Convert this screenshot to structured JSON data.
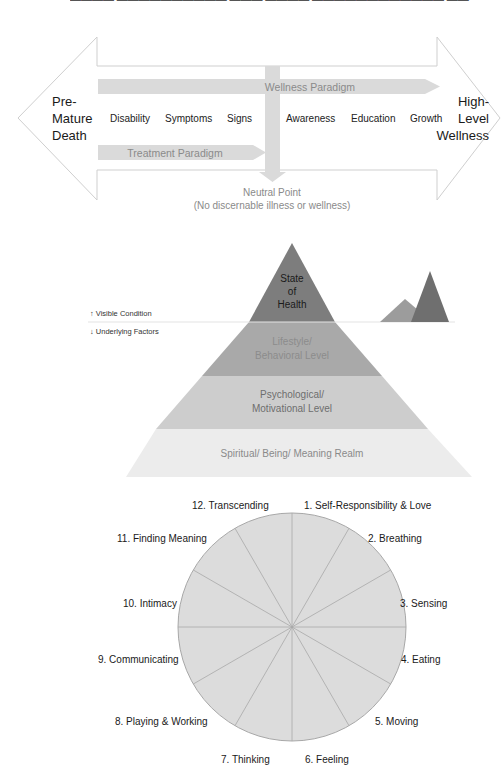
{
  "header": {
    "clipped_caption": "(text clipped at top edge — illegible)"
  },
  "continuum": {
    "left_end": [
      "Pre-",
      "Mature",
      "Death"
    ],
    "right_end": [
      "High-",
      "Level",
      "Wellness"
    ],
    "stages": [
      "Disability",
      "Symptoms",
      "Signs",
      "Awareness",
      "Education",
      "Growth"
    ],
    "wellness_paradigm": "Wellness Paradigm",
    "treatment_paradigm": "Treatment Paradigm",
    "neutral_point": "Neutral Point",
    "neutral_note": "(No discernable illness or wellness)"
  },
  "iceberg": {
    "above_label": "↑ Visible Condition",
    "below_label": "↓ Underlying Factors",
    "levels": [
      {
        "lines": [
          "State",
          "of",
          "Health"
        ],
        "color": "#7d7d7d",
        "text_color": "#1a1a1a"
      },
      {
        "lines": [
          "Lifestyle/",
          "Behavioral Level"
        ],
        "color": "#a9a9a9",
        "text_color": "#8c8c8c"
      },
      {
        "lines": [
          "Psychological/",
          "Motivational Level"
        ],
        "color": "#cdcdcd",
        "text_color": "#6e6e6e"
      },
      {
        "lines": [
          "Spiritual/ Being/ Meaning Realm"
        ],
        "color": "#ececec",
        "text_color": "#8a8a8a"
      }
    ],
    "mini_peaks": {
      "back_color": "#9c9c9c",
      "front_color": "#6f6f6f"
    }
  },
  "wheel": {
    "segments": [
      "1. Self-Responsibility & Love",
      "2. Breathing",
      "3. Sensing",
      "4. Eating",
      "5. Moving",
      "6. Feeling",
      "7. Thinking",
      "8. Playing & Working",
      "9. Communicating",
      "10. Intimacy",
      "11. Finding Meaning",
      "12. Transcending"
    ],
    "fill": "#dcdcdc",
    "stroke": "#a8a8a8"
  }
}
